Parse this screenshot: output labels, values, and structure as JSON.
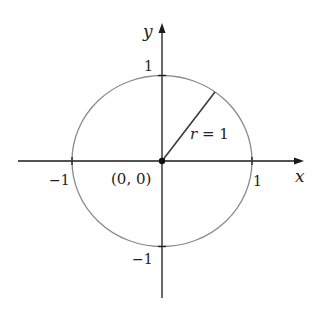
{
  "diagram": {
    "colors": {
      "axes": "#1a1a1a",
      "circle": "#8a8a8a",
      "radius": "#3a3a3a",
      "text": "#222222",
      "background": "#ffffff"
    },
    "axes": {
      "x_label": "x",
      "y_label": "y"
    },
    "ticks": {
      "x_pos": "1",
      "x_neg": "−1",
      "y_pos": "1",
      "y_neg": "−1"
    },
    "origin_label": "(0, 0)",
    "radius_label": {
      "var": "r",
      "eq": " = 1"
    }
  }
}
